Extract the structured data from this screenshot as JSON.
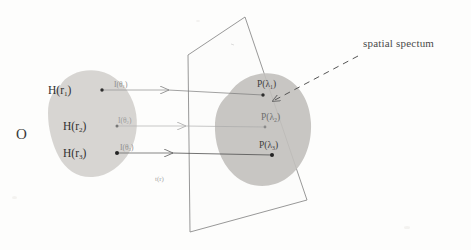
{
  "figure": {
    "background_color": "#fdfdfc"
  },
  "object": {
    "name_label": "O",
    "blob_fill": "#d5d3d0",
    "source_points": [
      {
        "label": "H(r",
        "sub": "1",
        "tail": ")",
        "x": 48,
        "y": 85,
        "dot_x": 102,
        "dot_y": 90
      },
      {
        "label": "H(r",
        "sub": "2",
        "tail": ")",
        "x": 63,
        "y": 121,
        "dot_x": 117,
        "dot_y": 126
      },
      {
        "label": "H(r",
        "sub": "3",
        "tail": ")",
        "x": 63,
        "y": 148,
        "dot_x": 117,
        "dot_y": 153
      }
    ]
  },
  "rays": [
    {
      "label": "I(θ",
      "sub": "1",
      "tail": ")",
      "x": 114,
      "y": 81,
      "from_x": 102,
      "to_x": 168,
      "y_line": 90,
      "color": "#9a9a9a"
    },
    {
      "label": "I(θ",
      "sub": "2",
      "tail": ")",
      "x": 118,
      "y": 117,
      "from_x": 117,
      "to_x": 185,
      "y_line": 126,
      "color": "#b4b4b4"
    },
    {
      "label": "I(θ",
      "sub": "3",
      "tail": ")",
      "x": 120,
      "y": 144,
      "from_x": 117,
      "to_x": 172,
      "y_line": 153,
      "color": "#8f8f8f"
    }
  ],
  "plane": {
    "label": "t(r)",
    "label_x": 155,
    "label_y": 176,
    "fill": "#fbfbfa",
    "stroke": "#8c8c8c",
    "corners": "188,55 245,17 307,200 190,232",
    "spectrum_blob_fill": "#c2c0bd"
  },
  "spectrum_points": [
    {
      "label": "P(λ",
      "sub": "1",
      "tail": ")",
      "x": 257,
      "y": 80,
      "dot_x": 263,
      "dot_y": 95
    },
    {
      "label": "P(λ",
      "sub": "2",
      "tail": ")",
      "x": 261,
      "y": 113,
      "dot_x": 265,
      "dot_y": 127
    },
    {
      "label": "P(λ",
      "sub": "3",
      "tail": ")",
      "x": 259,
      "y": 141,
      "dot_x": 272,
      "dot_y": 155
    }
  ],
  "annotation": {
    "caption": "spatial spectum",
    "caption_x": 363,
    "caption_y": 44,
    "leader_from_x": 358,
    "leader_from_y": 56,
    "leader_to_x": 273,
    "leader_to_y": 101,
    "dash": "6 5",
    "color": "#555555"
  }
}
